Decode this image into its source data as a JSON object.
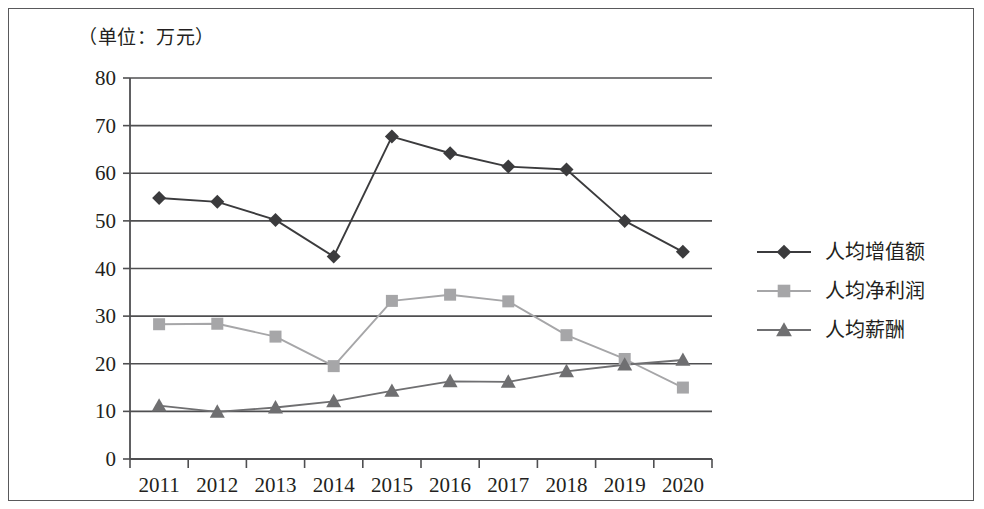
{
  "figure": {
    "unit_label": "（单位：万元）",
    "background_color": "#ffffff",
    "frame_color": "#59595b"
  },
  "chart_data": {
    "type": "line",
    "title": "",
    "subtitle": "",
    "unit_note": "（单位：万元）",
    "xlabel": "",
    "ylabel": "",
    "grid": true,
    "grid_axis": "y",
    "legend_position": "right",
    "ylim": [
      0,
      80
    ],
    "yticks": [
      0,
      10,
      20,
      30,
      40,
      50,
      60,
      70,
      80
    ],
    "ytick_labels": [
      "0",
      "10",
      "20",
      "30",
      "40",
      "50",
      "60",
      "70",
      "80"
    ],
    "categories": [
      "2011",
      "2012",
      "2013",
      "2014",
      "2015",
      "2016",
      "2017",
      "2018",
      "2019",
      "2020"
    ],
    "x": [
      2011,
      2012,
      2013,
      2014,
      2015,
      2016,
      2017,
      2018,
      2019,
      2020
    ],
    "series": [
      {
        "name": "人均增值额",
        "marker": "diamond",
        "color": "#3b3b3d",
        "values": [
          54.8,
          54.0,
          50.2,
          42.5,
          67.7,
          64.2,
          61.4,
          60.8,
          50.0,
          43.5
        ]
      },
      {
        "name": "人均净利润",
        "marker": "square",
        "color": "#a6a6a8",
        "values": [
          28.3,
          28.4,
          25.7,
          19.5,
          33.2,
          34.5,
          33.1,
          26.0,
          21.0,
          15.0
        ]
      },
      {
        "name": "人均薪酬",
        "marker": "triangle",
        "color": "#6f6f71",
        "values": [
          11.2,
          9.9,
          10.8,
          12.1,
          14.3,
          16.3,
          16.2,
          18.4,
          19.8,
          20.8
        ]
      }
    ]
  },
  "legend": {
    "items": [
      {
        "label": "人均增值额",
        "marker": "diamond",
        "color": "#3b3b3d"
      },
      {
        "label": "人均净利润",
        "marker": "square",
        "color": "#a6a6a8"
      },
      {
        "label": "人均薪酬",
        "marker": "triangle",
        "color": "#6f6f71"
      }
    ]
  }
}
